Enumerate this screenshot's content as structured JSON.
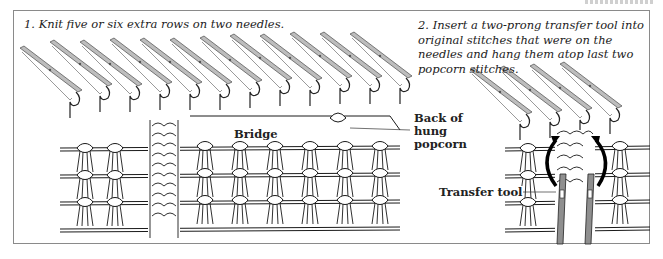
{
  "header": {
    "cutoff_text": "·····"
  },
  "panels": [
    {
      "step": 1,
      "caption": "1. Knit five or six extra rows on two needles.",
      "labels": {
        "bridge": "Bridge",
        "back_of_hung_popcorn": "Back of hung popcorn"
      }
    },
    {
      "step": 2,
      "caption": "2. Insert a two-prong transfer tool into original stitches that were on the needles and hang them atop last two popcorn stitches.",
      "labels": {
        "transfer_tool": "Transfer tool"
      }
    }
  ],
  "colors": {
    "line": "#1a1a1a",
    "needle_fill": "#b9b9b9",
    "tool_fill": "#8f8f8f",
    "frame": "#8a8a8a"
  }
}
